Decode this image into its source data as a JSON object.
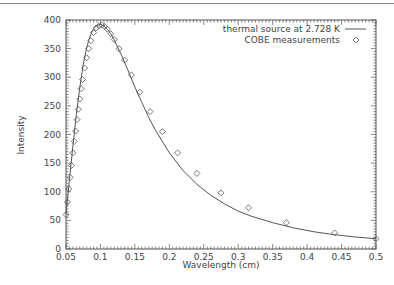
{
  "chart_data": {
    "type": "line",
    "title": "",
    "xlabel": "Wavelength (cm)",
    "ylabel": "Intensity",
    "xlim": [
      0.05,
      0.5
    ],
    "ylim": [
      0,
      400
    ],
    "grid": false,
    "legend_position": "top-right",
    "x_ticks": [
      "0.05",
      "0.1",
      "0.15",
      "0.2",
      "0.25",
      "0.3",
      "0.35",
      "0.4",
      "0.45",
      "0.5"
    ],
    "y_ticks": [
      "0",
      "50",
      "100",
      "150",
      "200",
      "250",
      "300",
      "350",
      "400"
    ],
    "series": [
      {
        "name": "thermal source at 2.728 K",
        "style": "line",
        "x": [
          0.05,
          0.055,
          0.06,
          0.065,
          0.07,
          0.075,
          0.08,
          0.085,
          0.09,
          0.095,
          0.1,
          0.105,
          0.11,
          0.115,
          0.12,
          0.13,
          0.14,
          0.15,
          0.16,
          0.17,
          0.18,
          0.2,
          0.22,
          0.24,
          0.26,
          0.28,
          0.3,
          0.32,
          0.35,
          0.38,
          0.41,
          0.44,
          0.47,
          0.5
        ],
        "values": [
          62,
          120,
          180,
          235,
          282,
          322,
          352,
          372,
          385,
          391,
          392,
          390,
          384,
          376,
          365,
          340,
          312,
          283,
          256,
          230,
          207,
          168,
          137,
          113,
          94,
          79,
          66,
          57,
          46,
          37,
          30,
          25,
          21,
          18
        ]
      },
      {
        "name": "COBE measurements",
        "style": "diamond-markers",
        "x": [
          0.05,
          0.052,
          0.054,
          0.056,
          0.058,
          0.06,
          0.062,
          0.064,
          0.066,
          0.068,
          0.07,
          0.072,
          0.074,
          0.077,
          0.08,
          0.083,
          0.086,
          0.09,
          0.094,
          0.098,
          0.102,
          0.106,
          0.11,
          0.115,
          0.12,
          0.127,
          0.135,
          0.145,
          0.157,
          0.172,
          0.19,
          0.212,
          0.24,
          0.275,
          0.315,
          0.37,
          0.44,
          0.5
        ],
        "values": [
          60,
          82,
          105,
          125,
          146,
          168,
          188,
          206,
          226,
          244,
          262,
          280,
          296,
          316,
          334,
          350,
          364,
          378,
          386,
          390,
          391,
          389,
          384,
          376,
          366,
          350,
          330,
          304,
          274,
          240,
          205,
          168,
          132,
          98,
          72,
          46,
          28,
          18
        ]
      }
    ]
  },
  "legend": {
    "line_label": "thermal source at 2.728 K",
    "marker_label": "COBE measurements"
  },
  "colors": {
    "line": "#555555",
    "marker": "#555555",
    "axis": "#555555",
    "text": "#444444"
  }
}
